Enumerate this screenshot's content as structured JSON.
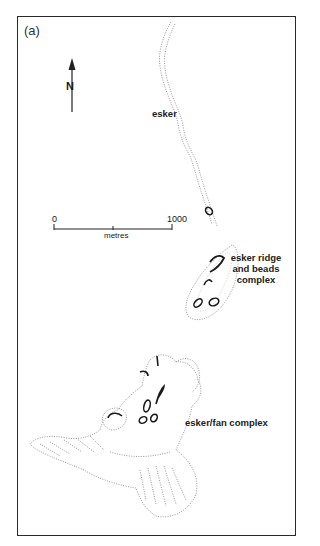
{
  "figure": {
    "panel_label": "(a)",
    "north_arrow": {
      "label": "N",
      "icon": "north-arrow-icon"
    },
    "scale_bar": {
      "start_label": "0",
      "end_label": "1000",
      "unit_label": "metres"
    },
    "features": [
      {
        "id": "esker",
        "label": "esker"
      },
      {
        "id": "ridge",
        "label_lines": [
          "esker ridge",
          "and beads",
          "complex"
        ]
      },
      {
        "id": "fan",
        "label": "esker/fan complex"
      }
    ],
    "colors": {
      "frame": "#2a2a2a",
      "stipple": "#8a8a8a",
      "ink": "#1a1a1a",
      "background": "#ffffff"
    }
  }
}
